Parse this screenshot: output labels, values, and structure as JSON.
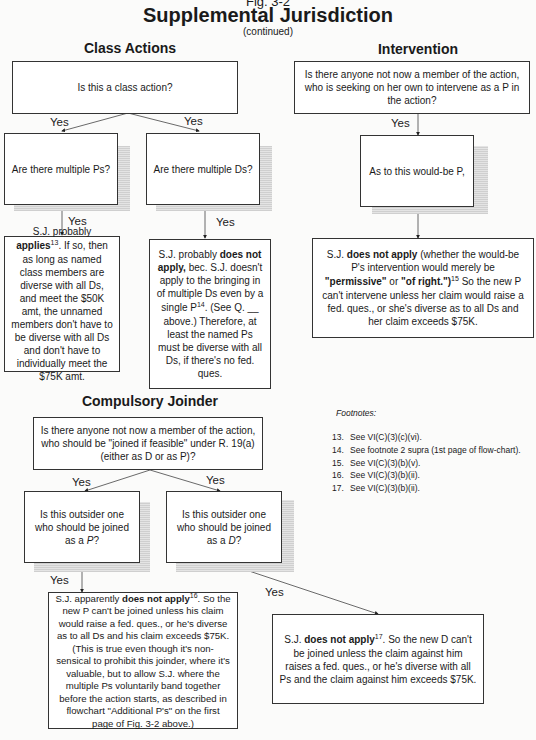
{
  "header": {
    "figure": "Fig. 3-2",
    "title": "Supplemental Jurisdiction",
    "subtitle": "(continued)"
  },
  "class_actions": {
    "heading": "Class Actions",
    "q1": "Is this a class action?",
    "yes_left": "Yes",
    "yes_right": "Yes",
    "q_ps": "Are there multiple Ps?",
    "q_ds": "Are there multiple Ds?",
    "yes_ps": "Yes",
    "yes_ds": "Yes",
    "ans_ps": {
      "pre": "S.J. probably ",
      "bold": "applies",
      "sup": "13",
      "post": ". If so, then as long as named class members are diverse with all Ds, and meet the $50K amt, the unnamed members don't have to be diverse with all Ds and don't have to individually meet the $75K amt."
    },
    "ans_ds": {
      "pre": "S.J. probably ",
      "bold": "does not apply,",
      "mid": " bec. S.J. doesn't apply to the bringing in of multiple Ds even by a single P",
      "sup": "14",
      "post": ". (See Q. __ above.) Therefore, at least the named Ps must be diverse with all Ds, if there's no fed. ques."
    }
  },
  "intervention": {
    "heading": "Intervention",
    "q1": "Is there anyone not now a member of the action, who is seeking on her own to intervene as a P in the action?",
    "yes": "Yes",
    "q2": "As to this would-be P,",
    "ans": {
      "pre": "S.J. ",
      "bold1": "does not apply",
      "mid1": " (whether the would-be P's intervention would merely be ",
      "bold2": "\"permissive\"",
      "mid2": " or ",
      "bold3": "\"of right.\")",
      "sup": "15",
      "post": " So the new P can't intervene unless her claim would raise a fed. ques., or she's diverse as to all Ds and her claim exceeds $75K."
    }
  },
  "compulsory_joinder": {
    "heading": "Compulsory Joinder",
    "q1": "Is there anyone not now a member of the action, who should be \"joined if feasible\" under R. 19(a) (either as D or as P)?",
    "yes_left": "Yes",
    "yes_right": "Yes",
    "q_p_pre": "Is this outsider one who should be joined as a ",
    "q_p_em": "P",
    "q_d_pre": "Is this outsider one who should be joined as a ",
    "q_d_em": "D",
    "q_end": "?",
    "yes_p": "Yes",
    "yes_d": "Yes",
    "ans_p": {
      "pre": "S.J. apparently  ",
      "bold": "does not apply",
      "sup": "16",
      "post": ". So the new P can't be joined unless his claim would raise a fed. ques., or he's diverse as to all Ds and his claim exceeds $75K. (This is true even though it's non-sensical to prohibit this joinder, where it's valuable, but to allow S.J. where the multiple Ps voluntarily band together before the action starts, as described in flowchart \"Additional P's\" on the first page of Fig. 3-2 above.)"
    },
    "ans_d": {
      "pre": "S.J. ",
      "bold": "does not apply",
      "sup": "17",
      "post": ". So the new D can't be joined unless the claim against him raises a fed. ques., or he's diverse with all Ps and the claim against him exceeds $75K."
    }
  },
  "footnotes": {
    "title": "Footnotes:",
    "items": [
      {
        "n": "13.",
        "text": "See VI(C)(3)(c)(vi)."
      },
      {
        "n": "14.",
        "text": "See footnote 2 supra (1st page of flow-chart)."
      },
      {
        "n": "15.",
        "text": "See VI(C)(3)(b)(v)."
      },
      {
        "n": "16.",
        "text": "See VI(C)(3)(b)(ii)."
      },
      {
        "n": "17.",
        "text": "See VI(C)(3)(b)(ii)."
      }
    ]
  }
}
